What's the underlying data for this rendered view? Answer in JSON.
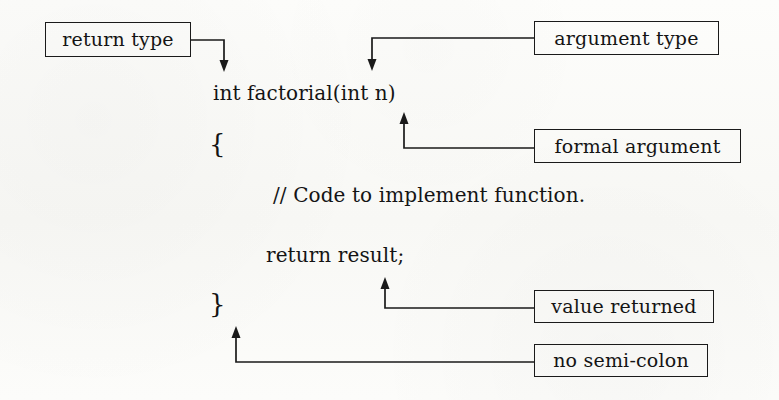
{
  "figure": {
    "ink_color": "#141414",
    "paper_color": "#fbfbf9"
  },
  "code": {
    "signature": "int factorial(int n)",
    "open_brace": "{",
    "comment": "// Code to implement function.",
    "return_statement": "return result;",
    "close_brace": "}"
  },
  "callouts": [
    {
      "id": "return-type",
      "label": "return type"
    },
    {
      "id": "argument-type",
      "label": "argument type"
    },
    {
      "id": "formal-argument",
      "label": "formal argument"
    },
    {
      "id": "value-returned",
      "label": "value returned"
    },
    {
      "id": "no-semi-colon",
      "label": "no semi-colon"
    }
  ]
}
